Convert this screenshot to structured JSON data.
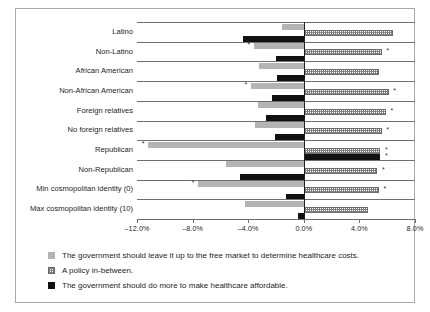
{
  "chart_data": {
    "type": "bar",
    "orientation": "horizontal",
    "title": "",
    "xlabel": "",
    "ylabel": "",
    "xlim": [
      -12.0,
      8.0
    ],
    "xtick_labels": [
      "–12.0%",
      "–8.0%",
      "–4.0%",
      "0.0%",
      "4.0%",
      "8.0%"
    ],
    "xtick_values": [
      -12.0,
      -8.0,
      -4.0,
      0.0,
      4.0,
      8.0
    ],
    "grid": false,
    "legend_position": "below",
    "zero_reference": 0.0,
    "significance_marker": "*",
    "categories": [
      "Latino",
      "Non-Latino",
      "African American",
      "Non-African American",
      "Foreign relatives",
      "No foreign relatives",
      "Republican",
      "Non-Republican",
      "Min cosmopolitan identity (0)",
      "Max cosmopolitan identity (10)"
    ],
    "series": [
      {
        "name": "The government should leave it up to the free market to determine healthcare costs.",
        "key": "free",
        "values": [
          -1.6,
          -3.6,
          -3.2,
          -3.8,
          -3.3,
          -3.5,
          -11.2,
          -5.6,
          -7.6,
          -4.2
        ],
        "significant": [
          false,
          true,
          false,
          true,
          false,
          false,
          true,
          false,
          true,
          false
        ]
      },
      {
        "name": "A policy in-between.",
        "key": "between",
        "values": [
          6.4,
          5.6,
          5.4,
          6.1,
          5.9,
          5.6,
          5.5,
          5.3,
          5.4,
          4.6
        ],
        "significant": [
          false,
          true,
          false,
          true,
          true,
          true,
          true,
          true,
          true,
          false
        ]
      },
      {
        "name": "The government should do more to make healthcare affordable.",
        "key": "more",
        "values": [
          -4.4,
          -2.0,
          -1.9,
          -2.3,
          -2.7,
          -2.1,
          5.5,
          -4.6,
          -1.3,
          -0.4
        ],
        "significant": [
          false,
          false,
          false,
          false,
          false,
          false,
          true,
          false,
          false,
          false
        ]
      }
    ]
  },
  "legend": {
    "items": [
      {
        "swatch": "free",
        "label": "The government should leave it up to the free market to determine healthcare costs."
      },
      {
        "swatch": "between",
        "label": "A policy in-between."
      },
      {
        "swatch": "more",
        "label": "The government should do more to make healthcare affordable."
      }
    ]
  }
}
